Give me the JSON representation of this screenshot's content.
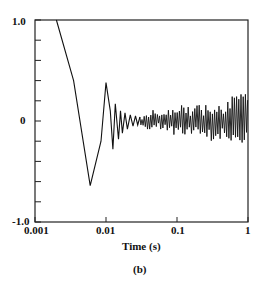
{
  "chart_data": {
    "type": "line",
    "title": "",
    "caption": "(b)",
    "xlabel": "Time (s)",
    "ylabel": "",
    "xscale": "log",
    "xlim": [
      0.001,
      1
    ],
    "ylim": [
      -1.0,
      1.0
    ],
    "grid": false,
    "legend": null,
    "x_ticks": [
      {
        "value": 0.001,
        "label": "0.001"
      },
      {
        "value": 0.01,
        "label": "0.01"
      },
      {
        "value": 0.1,
        "label": "0.1"
      },
      {
        "value": 1,
        "label": "1"
      }
    ],
    "y_ticks": [
      {
        "value": 1.0,
        "label": "1.0"
      },
      {
        "value": 0,
        "label": "0"
      },
      {
        "value": -1.0,
        "label": "-1.0"
      }
    ],
    "y_minor_ticks": [
      0.8,
      0.6,
      0.4,
      0.2,
      -0.2,
      -0.4,
      -0.6,
      -0.8
    ],
    "series": [
      {
        "name": "response",
        "color": "#111111",
        "description": "Damped oscillation decaying into noise around 0",
        "x": [
          0.002,
          0.0035,
          0.006,
          0.0085,
          0.01,
          0.0115,
          0.0125,
          0.0135,
          0.015,
          0.016,
          0.017,
          0.0185,
          0.02,
          0.022,
          0.024,
          0.026,
          0.028,
          0.03,
          0.035,
          0.04,
          0.05,
          0.06,
          0.07,
          0.08,
          0.1,
          0.15,
          0.2,
          0.3,
          0.4,
          0.5,
          0.7,
          1.0
        ],
        "values": [
          1.0,
          0.4,
          -0.64,
          -0.2,
          0.38,
          0.1,
          -0.28,
          0.17,
          -0.18,
          0.1,
          -0.12,
          0.08,
          -0.08,
          0.06,
          -0.05,
          0.05,
          -0.04,
          0.04,
          -0.06,
          0.05,
          -0.1,
          0.08,
          -0.12,
          0.12,
          -0.15,
          0.18,
          -0.2,
          0.22,
          -0.24,
          0.26,
          -0.28,
          0.25
        ],
        "noise_band": {
          "from_x": 0.03,
          "to_x": 1.0,
          "amplitude_start": 0.06,
          "amplitude_end": 0.28
        }
      }
    ]
  }
}
